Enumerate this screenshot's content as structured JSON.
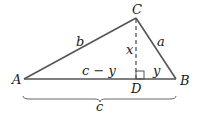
{
  "diagram": {
    "type": "triangle",
    "vertices": {
      "A": "A",
      "B": "B",
      "C": "C",
      "D": "D"
    },
    "sides": {
      "a": "a",
      "b": "b",
      "c": "c"
    },
    "segments": {
      "altitude": "x",
      "left_base": "c − y",
      "right_base": "y"
    },
    "brace_label": "c",
    "line_color": "#555555"
  }
}
